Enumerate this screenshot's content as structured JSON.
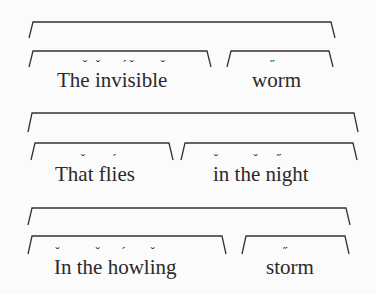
{
  "legend": {
    "breve": "˘",
    "stress": "´",
    "double_stress": "˝"
  },
  "lines": [
    {
      "outer_bracket": {
        "x1": 29,
        "x2": 335,
        "top": 22,
        "bottom": 38
      },
      "phrases": [
        {
          "text": "The invisible",
          "x": 57,
          "y": 70,
          "bracket": {
            "x1": 29,
            "x2": 211,
            "top": 51,
            "bottom": 67
          },
          "chars": [
            {
              "c": "T"
            },
            {
              "c": "h"
            },
            {
              "c": "e",
              "m": "ˇ"
            },
            {
              "c": " "
            },
            {
              "c": "i",
              "m": "ˇ"
            },
            {
              "c": "n"
            },
            {
              "c": "v"
            },
            {
              "c": "i",
              "m": "´"
            },
            {
              "c": "s",
              "m": "ˇ"
            },
            {
              "c": "i"
            },
            {
              "c": "b"
            },
            {
              "c": "l"
            },
            {
              "c": "e",
              "m": "ˇ"
            }
          ]
        },
        {
          "text": "worm",
          "x": 252,
          "y": 70,
          "bracket": {
            "x1": 227,
            "x2": 333,
            "top": 51,
            "bottom": 67
          },
          "chars": [
            {
              "c": "w"
            },
            {
              "c": "o",
              "m": "˝"
            },
            {
              "c": "r"
            },
            {
              "c": "m"
            }
          ]
        }
      ]
    },
    {
      "outer_bracket": {
        "x1": 28,
        "x2": 358,
        "top": 113,
        "bottom": 132
      },
      "phrases": [
        {
          "text": "That flies",
          "x": 55,
          "y": 164,
          "bracket": {
            "x1": 31,
            "x2": 173,
            "top": 143,
            "bottom": 160
          },
          "chars": [
            {
              "c": "T"
            },
            {
              "c": "h"
            },
            {
              "c": "a",
              "m": "ˇ"
            },
            {
              "c": "t"
            },
            {
              "c": " "
            },
            {
              "c": "f"
            },
            {
              "c": "l"
            },
            {
              "c": "i",
              "m": "´"
            },
            {
              "c": "e"
            },
            {
              "c": "s"
            }
          ]
        },
        {
          "text": "in the night",
          "x": 213,
          "y": 164,
          "bracket": {
            "x1": 181,
            "x2": 357,
            "top": 143,
            "bottom": 160
          },
          "chars": [
            {
              "c": "i",
              "m": "ˇ"
            },
            {
              "c": "n"
            },
            {
              "c": " "
            },
            {
              "c": "t"
            },
            {
              "c": "h"
            },
            {
              "c": "e",
              "m": "ˇ"
            },
            {
              "c": " "
            },
            {
              "c": "n"
            },
            {
              "c": "i",
              "m": "˝"
            },
            {
              "c": "g"
            },
            {
              "c": "h"
            },
            {
              "c": "t"
            }
          ]
        }
      ]
    },
    {
      "outer_bracket": {
        "x1": 28,
        "x2": 350,
        "top": 208,
        "bottom": 225
      },
      "phrases": [
        {
          "text": "In the howling",
          "x": 54,
          "y": 257,
          "bracket": {
            "x1": 28,
            "x2": 226,
            "top": 236,
            "bottom": 254
          },
          "chars": [
            {
              "c": "I",
              "m": "ˇ"
            },
            {
              "c": "n"
            },
            {
              "c": " "
            },
            {
              "c": "t"
            },
            {
              "c": "h"
            },
            {
              "c": "e",
              "m": "ˇ"
            },
            {
              "c": " "
            },
            {
              "c": "h"
            },
            {
              "c": "o",
              "m": "´"
            },
            {
              "c": "w"
            },
            {
              "c": "l"
            },
            {
              "c": "i",
              "m": "ˇ"
            },
            {
              "c": "n"
            },
            {
              "c": "g"
            }
          ]
        },
        {
          "text": "storm",
          "x": 266,
          "y": 257,
          "bracket": {
            "x1": 242,
            "x2": 349,
            "top": 236,
            "bottom": 254
          },
          "chars": [
            {
              "c": "s"
            },
            {
              "c": "t"
            },
            {
              "c": "o",
              "m": "˝"
            },
            {
              "c": "r"
            },
            {
              "c": "m"
            }
          ]
        }
      ]
    }
  ]
}
